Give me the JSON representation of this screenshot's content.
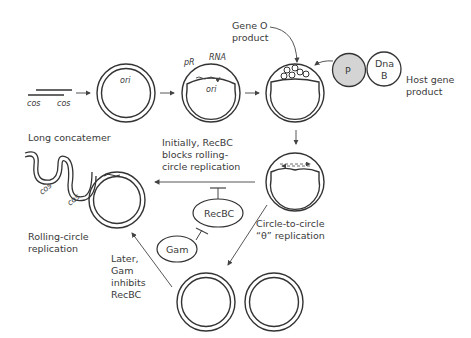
{
  "diagram": {
    "stages": {
      "linear_dna": {
        "cos_left": "cos",
        "cos_right": "cos"
      },
      "circularized": {
        "ori_label": "ori"
      },
      "transcription": {
        "promoter_label": "pR",
        "rna_label": "RNA",
        "ori_label": "ori"
      },
      "gene_o": {
        "label_line1": "Gene O",
        "label_line2": "product"
      },
      "host": {
        "p_label": "P",
        "dnab_line1": "Dna",
        "dnab_line2": "B",
        "label_line1": "Host gene",
        "label_line2": "product"
      },
      "theta": {
        "label_line1": "Circle-to-circle",
        "label_line2": "“θ” replication"
      },
      "recbc_block": {
        "line1": "Initially, RecBC",
        "line2": "blocks rolling-",
        "line3": "circle replication"
      },
      "concatemer": {
        "label": "Long concatemer",
        "cos1": "cos",
        "cos2": "cos"
      },
      "rolling_circle": {
        "line1": "Rolling-circle",
        "line2": "replication"
      },
      "gam_inhibit": {
        "line1": "Later,",
        "line2": "Gam",
        "line3": "inhibits",
        "line4": "RecBC"
      },
      "proteins": {
        "recbc": "RecBC",
        "gam": "Gam"
      }
    },
    "colors": {
      "line": "#333333",
      "p_fill": "#d4d4d4",
      "arrow": "#555555"
    }
  }
}
